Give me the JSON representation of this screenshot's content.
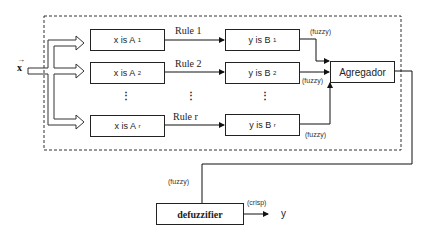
{
  "diagram": {
    "input": {
      "label": "x",
      "vector_arrow": true
    },
    "rules": [
      {
        "label": "Rule 1",
        "antecedent": {
          "text": "x is A",
          "sub": "1"
        },
        "consequent": {
          "text": "y is B",
          "sub": "1"
        },
        "output_tag": "(fuzzy)"
      },
      {
        "label": "Rule 2",
        "antecedent": {
          "text": "x is A",
          "sub": "2"
        },
        "consequent": {
          "text": "y is B",
          "sub": "2"
        },
        "output_tag": "(fuzzy)"
      },
      {
        "label": "Rule r",
        "antecedent": {
          "text": "x is A",
          "sub": "r"
        },
        "consequent": {
          "text": "y is B",
          "sub": "r"
        },
        "output_tag": "(fuzzy)"
      }
    ],
    "ellipsis": "⋮",
    "aggregator": {
      "label": "Agregador"
    },
    "aggregator_output_tag": "(fuzzy)",
    "defuzzifier": {
      "label": "defuzzifier"
    },
    "defuzzifier_output_tag": "(crisp)",
    "output": {
      "label": "y"
    }
  }
}
